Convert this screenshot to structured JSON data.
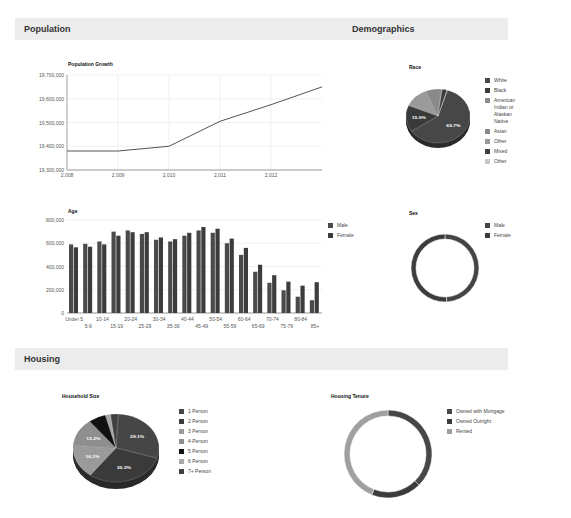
{
  "sections": {
    "population": "Population",
    "demographics": "Demographics",
    "housing": "Housing"
  },
  "colors": {
    "series_dark": "#454545",
    "series_mid": "#3a3a3a",
    "light_gray": "#9a9a9a",
    "black": "#111111",
    "section_bg": "#ececec",
    "grid": "#e4e4e4"
  },
  "chart_data": [
    {
      "id": "population_growth",
      "type": "line",
      "title": "Population Growth",
      "xlabel": "",
      "ylabel": "",
      "x": [
        2008,
        2009,
        2010,
        2011,
        2012,
        2013
      ],
      "x_tick_labels": [
        "2,008",
        "2,009",
        "2,010",
        "2,011",
        "2,012"
      ],
      "values": [
        19380000,
        19380000,
        19400000,
        19505000,
        19575000,
        19650000
      ],
      "y_tick_labels": [
        "19,700,000",
        "19,600,000",
        "19,500,000",
        "19,400,000",
        "19,300,000"
      ],
      "ylim": [
        19300000,
        19700000
      ],
      "grid": true,
      "legend": "none"
    },
    {
      "id": "age",
      "type": "bar",
      "title": "Age",
      "categories": [
        "Under 5",
        "5-9",
        "10-14",
        "15-19",
        "20-24",
        "25-29",
        "30-34",
        "35-39",
        "40-44",
        "45-49",
        "50-54",
        "55-59",
        "60-64",
        "65-69",
        "70-74",
        "75-79",
        "80-84",
        "85+"
      ],
      "series": [
        {
          "name": "Male",
          "values": [
            590000,
            595000,
            615000,
            700000,
            710000,
            680000,
            630000,
            615000,
            665000,
            710000,
            690000,
            600000,
            500000,
            355000,
            260000,
            195000,
            140000,
            110000
          ]
        },
        {
          "name": "Female",
          "values": [
            565000,
            570000,
            590000,
            665000,
            695000,
            695000,
            650000,
            635000,
            690000,
            740000,
            725000,
            640000,
            560000,
            415000,
            325000,
            270000,
            235000,
            265000
          ]
        }
      ],
      "y_tick_labels": [
        "800,000",
        "600,000",
        "400,000",
        "200,000",
        "0"
      ],
      "ylim": [
        0,
        800000
      ],
      "grid": true,
      "legend_position": "right"
    },
    {
      "id": "race",
      "type": "pie",
      "title": "Race",
      "categories": [
        "White",
        "Black",
        "American Indian or Alaskan Native",
        "Asian",
        "Other",
        "Mixed",
        "Other"
      ],
      "values": [
        60.7,
        15.9,
        0.3,
        8.0,
        12.5,
        2.4,
        0.2
      ],
      "slice_labels": [
        "60.7%",
        "15.9%"
      ],
      "legend_position": "right",
      "style": "3d"
    },
    {
      "id": "sex",
      "type": "pie",
      "style": "donut",
      "title": "Sex",
      "categories": [
        "Male",
        "Female"
      ],
      "values": [
        49.2,
        50.8
      ],
      "legend_position": "right"
    },
    {
      "id": "household_size",
      "type": "pie",
      "style": "3d",
      "title": "Household Size",
      "categories": [
        "1 Person",
        "2 Person",
        "3 Person",
        "4 Person",
        "5 Person",
        "6 Person",
        "7+ Person"
      ],
      "values": [
        29.1,
        30.3,
        16.1,
        13.2,
        6.5,
        2.0,
        2.8
      ],
      "slice_labels": [
        "29.1%",
        "30.3%",
        "16.1%",
        "13.2%"
      ],
      "legend_position": "right"
    },
    {
      "id": "housing_tenure",
      "type": "pie",
      "style": "donut",
      "title": "Housing Tenure",
      "categories": [
        "Owned with Mortgage",
        "Owned Outright",
        "Rented"
      ],
      "values": [
        37.5,
        18.5,
        44.0
      ],
      "legend_position": "right"
    }
  ]
}
